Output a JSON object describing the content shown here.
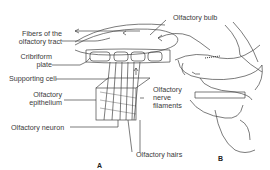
{
  "diagram": {
    "panels": [
      {
        "id": "A",
        "label": "A"
      },
      {
        "id": "B",
        "label": "B"
      }
    ],
    "labels": {
      "fibers_line1": "Fibers of the",
      "fibers_line2": "olfactory tract",
      "cribriform_line1": "Cribriform",
      "cribriform_line2": "plate",
      "supporting_cell": "Supporting cell",
      "epithelium_line1": "Olfactory",
      "epithelium_line2": "epithelium",
      "neuron": "Olfactory neuron",
      "bulb": "Olfactory bulb",
      "nerve_line1": "Olfactory",
      "nerve_line2": "nerve",
      "nerve_line3": "filaments",
      "hairs": "Olfactory hairs"
    },
    "colors": {
      "line": "#444444",
      "text": "#3a3a3a",
      "background": "#ffffff"
    }
  }
}
